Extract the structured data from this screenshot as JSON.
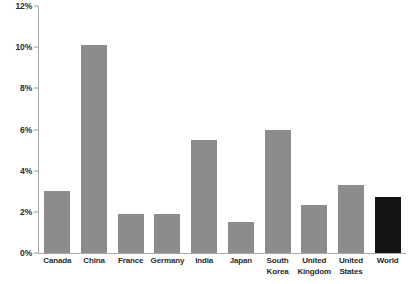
{
  "chart_data": {
    "type": "bar",
    "title": "",
    "subtitle": "",
    "xlabel": "",
    "ylabel": "",
    "categories": [
      "Canada",
      "China",
      "France",
      "Germany",
      "India",
      "Japan",
      "South Korea",
      "United Kingdom",
      "United States",
      "World"
    ],
    "values": [
      3.0,
      10.1,
      1.9,
      1.9,
      5.5,
      1.5,
      6.0,
      2.35,
      3.3,
      2.7
    ],
    "value_labels": [
      "3.0%",
      "10.1%",
      "1.9%",
      "1.9%",
      "5.5%",
      "1.5%",
      "6.0%",
      "2.4%",
      "3.3%",
      "2.7%"
    ],
    "bar_colors": [
      "#8c8c8c",
      "#8c8c8c",
      "#8c8c8c",
      "#8c8c8c",
      "#8c8c8c",
      "#8c8c8c",
      "#8c8c8c",
      "#8c8c8c",
      "#8c8c8c",
      "#141414"
    ],
    "ylim": [
      0,
      12
    ],
    "yticks": [
      0,
      2,
      4,
      6,
      8,
      10,
      12
    ],
    "ytick_labels": [
      "0%",
      "2%",
      "4%",
      "6%",
      "8%",
      "10%",
      "12%"
    ],
    "grid": false,
    "legend": null,
    "axis_color": "#a8a8a8",
    "label_color": "#2b2b2b",
    "background": "#ffffff"
  }
}
